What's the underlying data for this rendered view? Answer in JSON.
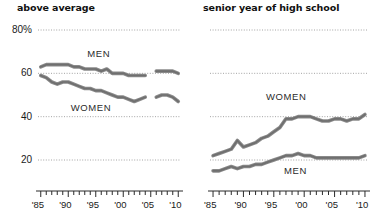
{
  "chart_data": [
    {
      "type": "line",
      "title": "above average",
      "panel": "left",
      "xlabel": "",
      "ylabel": "",
      "ylim": [
        10,
        85
      ],
      "yticks": [
        20,
        40,
        60,
        80
      ],
      "yticklabels": [
        "20",
        "40",
        "60",
        "80%"
      ],
      "xlim": [
        1984.5,
        2010.5
      ],
      "xticklabels": [
        "'85",
        "'90",
        "'95",
        "'00",
        "'05",
        "'10"
      ],
      "xtickvalues": [
        1985,
        1990,
        1995,
        2000,
        2005,
        2010
      ],
      "grid": true,
      "legend_position": "inline-annotation",
      "series": [
        {
          "name": "MEN",
          "label_x": 1996,
          "label_y": 69,
          "x": [
            1985,
            1986,
            1987,
            1988,
            1989,
            1990,
            1991,
            1992,
            1993,
            1994,
            1995,
            1996,
            1997,
            1998,
            1999,
            2000,
            2001,
            2002,
            2003,
            2004
          ],
          "values": [
            63,
            64,
            64,
            64,
            64,
            64,
            63,
            63,
            62,
            62,
            62,
            61,
            62,
            60,
            60,
            60,
            59,
            59,
            59,
            59
          ]
        },
        {
          "name": "MEN",
          "label_x": null,
          "label_y": null,
          "x": [
            2006,
            2007,
            2008,
            2009,
            2010
          ],
          "values": [
            61,
            61,
            61,
            61,
            60
          ]
        },
        {
          "name": "WOMEN",
          "label_x": 1993,
          "label_y": 44,
          "x": [
            1985,
            1986,
            1987,
            1988,
            1989,
            1990,
            1991,
            1992,
            1993,
            1994,
            1995,
            1996,
            1997,
            1998,
            1999,
            2000,
            2001,
            2002,
            2003,
            2004
          ],
          "values": [
            59,
            58,
            56,
            55,
            56,
            56,
            55,
            54,
            53,
            53,
            52,
            52,
            51,
            50,
            49,
            49,
            48,
            47,
            48,
            49
          ]
        },
        {
          "name": "WOMEN",
          "label_x": null,
          "label_y": null,
          "x": [
            2006,
            2007,
            2008,
            2009,
            2010
          ],
          "values": [
            49,
            50,
            50,
            49,
            47
          ]
        }
      ]
    },
    {
      "type": "line",
      "title": "senior year of high school",
      "panel": "right",
      "xlabel": "",
      "ylabel": "",
      "ylim": [
        10,
        85
      ],
      "yticks": [
        20,
        40,
        60,
        80
      ],
      "yticklabels": [
        "20",
        "40",
        "60",
        "80%"
      ],
      "xlim": [
        1984.5,
        2010.5
      ],
      "xticklabels": [
        "'85",
        "'90",
        "'95",
        "'00",
        "'05",
        "'10"
      ],
      "xtickvalues": [
        1985,
        1990,
        1995,
        2000,
        2005,
        2010
      ],
      "grid": true,
      "legend_position": "inline-annotation",
      "series": [
        {
          "name": "WOMEN",
          "label_x": 1996,
          "label_y": 49,
          "x": [
            1985,
            1986,
            1987,
            1988,
            1989,
            1990,
            1991,
            1992,
            1993,
            1994,
            1995,
            1996,
            1997,
            1998,
            1999,
            2000,
            2001,
            2002,
            2003,
            2004,
            2005,
            2006,
            2007,
            2008,
            2009,
            2010
          ],
          "values": [
            22,
            23,
            24,
            25,
            29,
            26,
            27,
            28,
            30,
            31,
            33,
            35,
            39,
            39,
            40,
            40,
            40,
            39,
            38,
            38,
            39,
            39,
            38,
            39,
            39,
            41
          ]
        },
        {
          "name": "MEN",
          "label_x": 1999,
          "label_y": 15,
          "x": [
            1985,
            1986,
            1987,
            1988,
            1989,
            1990,
            1991,
            1992,
            1993,
            1994,
            1995,
            1996,
            1997,
            1998,
            1999,
            2000,
            2001,
            2002,
            2003,
            2004,
            2005,
            2006,
            2007,
            2008,
            2009,
            2010
          ],
          "values": [
            15,
            15,
            16,
            17,
            16,
            17,
            17,
            18,
            18,
            19,
            20,
            21,
            22,
            22,
            23,
            22,
            22,
            21,
            21,
            21,
            21,
            21,
            21,
            21,
            21,
            22
          ]
        }
      ]
    }
  ],
  "style": {
    "line_color": "#8a8a8a",
    "grid_color": "#9a9a9a",
    "text_color": "#1a1a1a",
    "background": "#ffffff"
  }
}
